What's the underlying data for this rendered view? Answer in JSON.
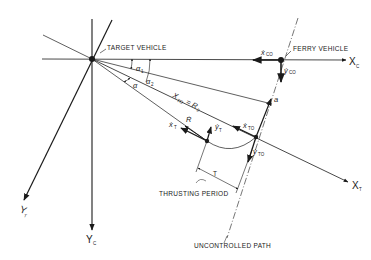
{
  "labels": {
    "target_vehicle": "TARGET VEHICLE",
    "ferry_vehicle": "FERRY VEHICLE",
    "thrusting_period": "THRUSTING PERIOD",
    "uncontrolled_path": "UNCONTROLLED PATH",
    "tau": "T",
    "x_to_eq": "X",
    "x_to_eq_sub": "TO",
    "x_to_eq_rhs": "= R",
    "x_to_eq_rhs_sub": "2"
  },
  "axes": {
    "xc": "X",
    "xc_sub": "C",
    "yc": "Y",
    "yc_sub": "C",
    "xt": "X",
    "xt_sub": "T",
    "yt": "Y",
    "yt_sub": "T"
  },
  "angles": {
    "alpha1": "α",
    "alpha1_sub": "1",
    "alpha2": "α",
    "alpha2_sub": "2",
    "alpha": "α"
  },
  "vectors": {
    "x_co": "ẋ",
    "x_co_sub": "CO",
    "y_co": "ẏ",
    "y_co_sub": "CO",
    "a": "a",
    "x_to": "ẋ",
    "x_to_sub": "TO",
    "y_to": "ẏ",
    "y_to_sub": "TO",
    "x_t": "ẋ",
    "x_t_sub": "T",
    "y_t": "ẏ",
    "y_t_sub": "T",
    "r": "Ṙ"
  },
  "colors": {
    "ink": "#1a1a1a",
    "background": "#ffffff"
  }
}
